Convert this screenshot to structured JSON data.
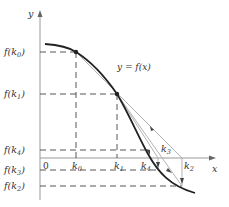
{
  "diagram": {
    "axes": {
      "x_label": "x",
      "y_label": "y",
      "origin_label": "0"
    },
    "curve_label": "y = f(x)",
    "y_tick_labels": [
      {
        "text": "f(k",
        "sub": "0",
        "close": ")"
      },
      {
        "text": "f(k",
        "sub": "1",
        "close": ")"
      },
      {
        "text": "f(k",
        "sub": "4",
        "close": ")"
      },
      {
        "text": "f(k",
        "sub": "3",
        "close": ")"
      },
      {
        "text": "f(k",
        "sub": "2",
        "close": ")"
      }
    ],
    "x_tick_labels": [
      {
        "text": "k",
        "sub": "0"
      },
      {
        "text": "k",
        "sub": "1"
      },
      {
        "text": "k",
        "sub": "4"
      },
      {
        "text": "k",
        "sub": "3"
      },
      {
        "text": "k",
        "sub": "2"
      }
    ],
    "colors": {
      "curve": "#222222",
      "dash": "#444444",
      "secant": "#aaaaaa",
      "axis": "#999999"
    }
  }
}
